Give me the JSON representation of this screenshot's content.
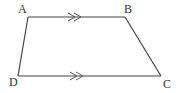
{
  "diagram": {
    "type": "trapezium",
    "colors": {
      "stroke": "#444444",
      "label": "#333333",
      "background": "#ffffff"
    },
    "vertices": [
      {
        "id": "A",
        "label": "A",
        "x": 28,
        "y": 17,
        "label_x": 18,
        "label_y": 13
      },
      {
        "id": "B",
        "label": "B",
        "x": 125,
        "y": 17,
        "label_x": 124,
        "label_y": 13
      },
      {
        "id": "C",
        "label": "C",
        "x": 161,
        "y": 76,
        "label_x": 163,
        "label_y": 88
      },
      {
        "id": "D",
        "label": "D",
        "x": 18,
        "y": 76,
        "label_x": 10,
        "label_y": 86
      }
    ],
    "edges": [
      {
        "from": "A",
        "to": "B",
        "parallel_mark": "double-arrow"
      },
      {
        "from": "B",
        "to": "C"
      },
      {
        "from": "C",
        "to": "D",
        "parallel_mark": "double-arrow"
      },
      {
        "from": "D",
        "to": "A"
      }
    ],
    "parallel_marks": [
      {
        "edge": "AB",
        "count": 2,
        "direction": "right",
        "x": 70,
        "y": 17
      },
      {
        "edge": "DC",
        "count": 2,
        "direction": "right",
        "x": 70,
        "y": 76
      }
    ]
  }
}
